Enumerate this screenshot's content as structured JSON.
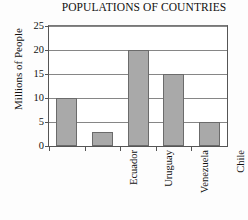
{
  "chart_data": {
    "type": "bar",
    "title": "POPULATIONS OF COUNTRIES",
    "xlabel": "",
    "ylabel": "Millions of People",
    "categories": [
      "Ecuador",
      "Uruguay",
      "Venezuela",
      "Chile",
      "Paraguay"
    ],
    "values": [
      10,
      3,
      20,
      15,
      5
    ],
    "yticks": [
      0,
      5,
      10,
      15,
      20,
      25
    ],
    "ylim": [
      0,
      25
    ],
    "grid": true,
    "legend": false,
    "bar_color": "#a9a9a9",
    "bar_border_color": "#6b6b6b",
    "grid_color": "#868686",
    "axis_color": "#555555"
  }
}
